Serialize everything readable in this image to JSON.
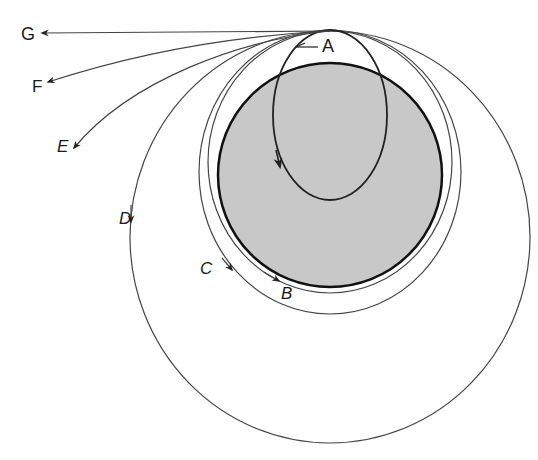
{
  "diagram": {
    "title": "",
    "colors": {
      "earth_fill": "#c8c8c8",
      "line": "#333333",
      "background": "#ffffff"
    },
    "earth": {
      "cx": 330,
      "cy": 175,
      "r": 112
    },
    "launch_point": {
      "x": 330,
      "y": 31
    },
    "trajectories": [
      {
        "id": "A",
        "label": "A",
        "type": "ellipse-through-earth"
      },
      {
        "id": "B",
        "label": "B",
        "type": "near-circular-orbit"
      },
      {
        "id": "C",
        "label": "C",
        "type": "circular-orbit"
      },
      {
        "id": "D",
        "label": "D",
        "type": "elliptical-orbit"
      },
      {
        "id": "E",
        "label": "E",
        "type": "escape-parabolic"
      },
      {
        "id": "F",
        "label": "F",
        "type": "escape-hyperbolic"
      },
      {
        "id": "G",
        "label": "G",
        "type": "escape-straight"
      }
    ]
  },
  "labels": {
    "A": "A",
    "B": "B",
    "C": "C",
    "D": "D",
    "E": "E",
    "F": "F",
    "G": "G"
  }
}
